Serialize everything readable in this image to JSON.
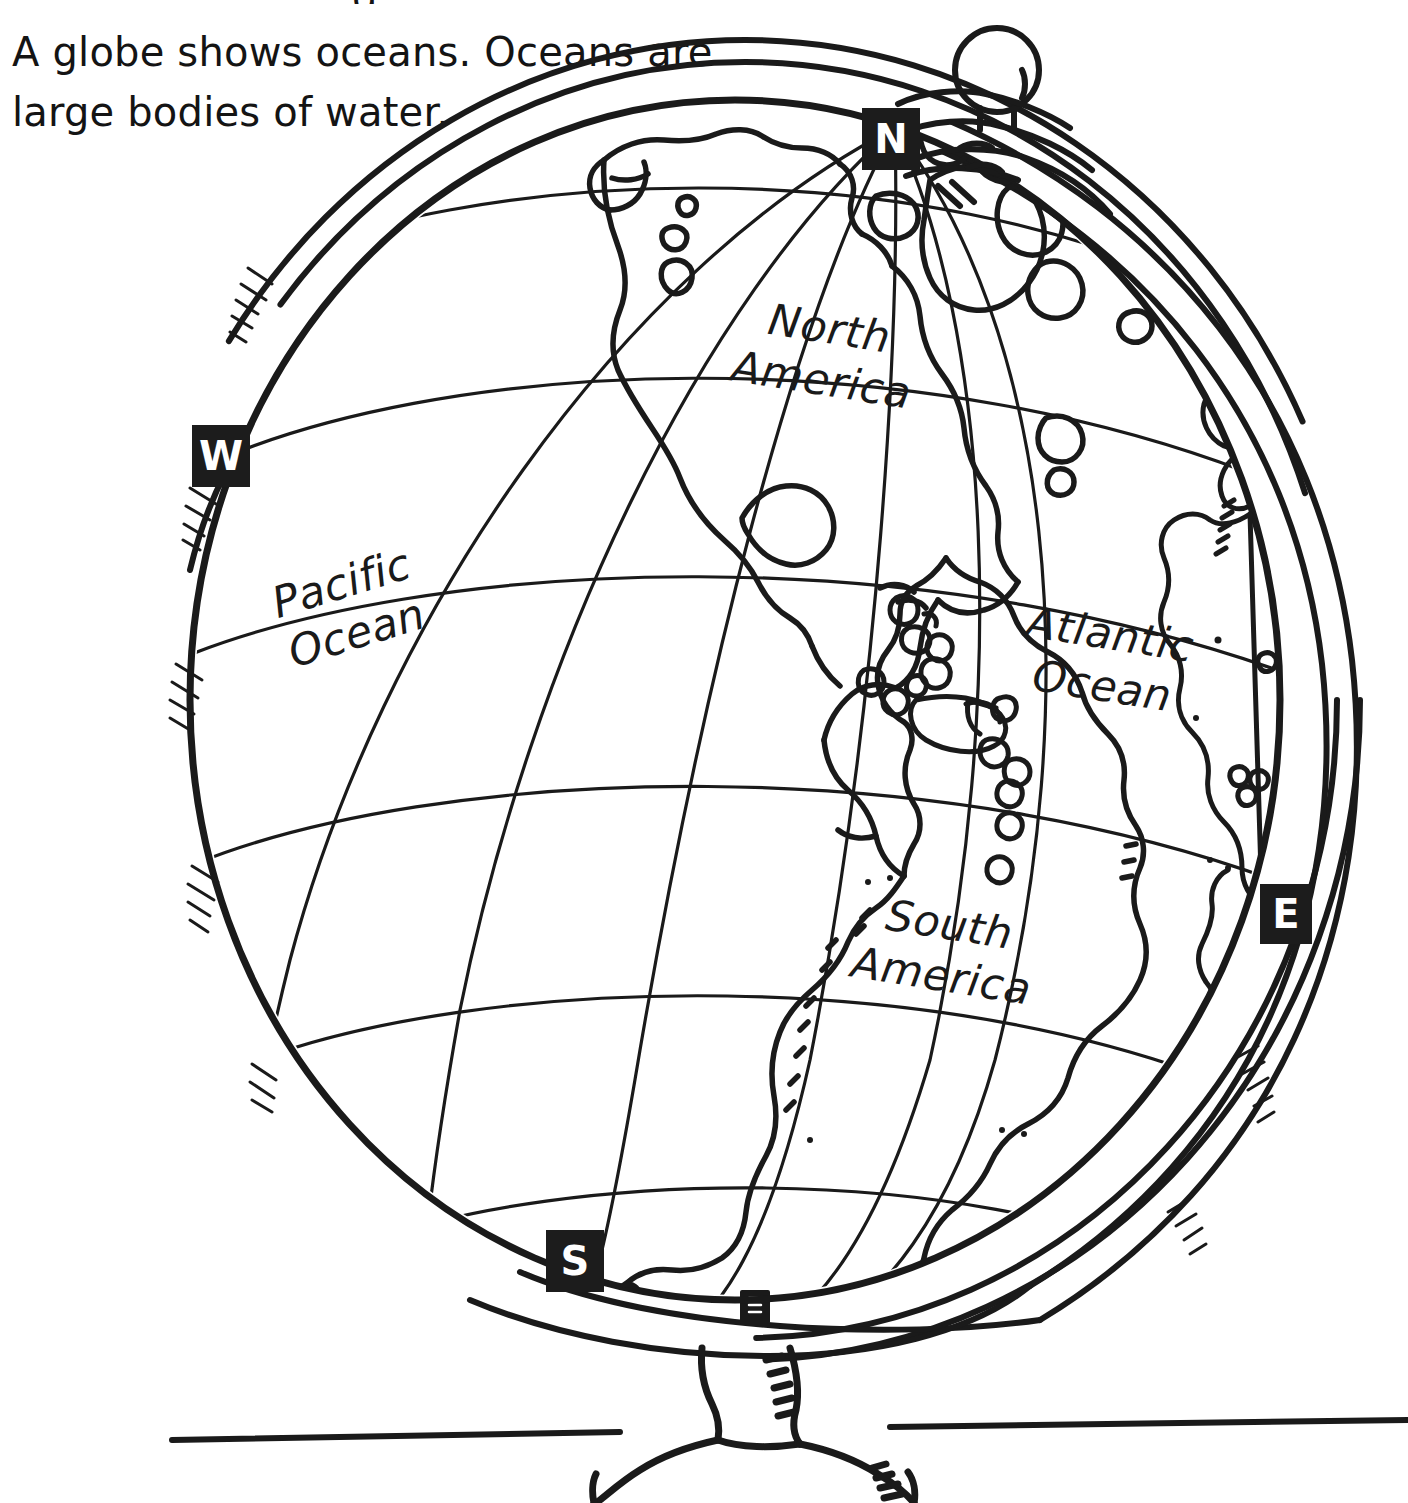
{
  "page": {
    "background_color": "#ffffff",
    "ink_color": "#1a1a1a",
    "marker_bg_color": "#1c1c1c",
    "marker_text_color": "#ffffff"
  },
  "caption": {
    "text": "A globe shows oceans. Oceans are\nlarge bodies of water.",
    "clipped_top_glyph": "g"
  },
  "illustration": {
    "subject": "desk globe on a pedestal stand",
    "style": "black and white line art coloring-page",
    "horizon_line": true
  },
  "compass_markers": [
    {
      "id": "north",
      "label": "N"
    },
    {
      "id": "west",
      "label": "W"
    },
    {
      "id": "east",
      "label": "E"
    },
    {
      "id": "south",
      "label": "S"
    }
  ],
  "map_labels": [
    {
      "id": "north-america",
      "text": "North\nAmerica"
    },
    {
      "id": "south-america",
      "text": "South\nAmerica"
    },
    {
      "id": "pacific-ocean",
      "text": "Pacific\nOcean"
    },
    {
      "id": "atlantic-ocean",
      "text": "Atlantic\nOcean"
    }
  ]
}
